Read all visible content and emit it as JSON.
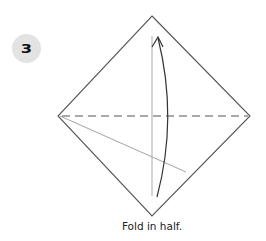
{
  "step": {
    "number": "3",
    "instruction": "Fold in half."
  },
  "colors": {
    "badge_bg": "#e3e3e3",
    "outline": "#555555",
    "crease": "#aaaaaa",
    "arrow": "#333333"
  }
}
